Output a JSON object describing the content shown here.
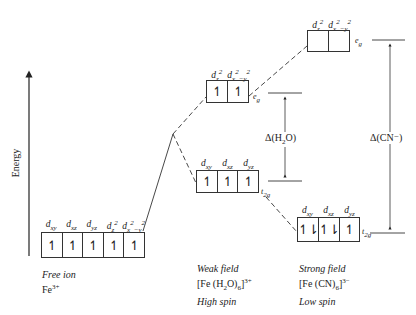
{
  "axis": {
    "label": "Energy"
  },
  "free_ion": {
    "orbitals": [
      "d_xy",
      "d_xz",
      "d_yz",
      "d_z²",
      "d_x²−y²"
    ],
    "occupancy": [
      "↿",
      "↿",
      "↿",
      "↿",
      "↿"
    ],
    "caption": {
      "line1": "Free ion",
      "line2": "Fe3+"
    }
  },
  "weak_field": {
    "eg": {
      "label": "eg",
      "orbitals": [
        "d_z²",
        "d_x²−y²"
      ],
      "occupancy": [
        "↿",
        "↿"
      ]
    },
    "t2g": {
      "label": "t2g",
      "orbitals": [
        "d_xy",
        "d_xz",
        "d_yz"
      ],
      "occupancy": [
        "↿",
        "↿",
        "↿"
      ]
    },
    "delta_label": "Δ(H2O)",
    "caption": {
      "line1": "Weak field",
      "line2": "[Fe (H2O)6]3+",
      "line3": "High spin"
    }
  },
  "strong_field": {
    "eg": {
      "label": "eg",
      "orbitals": [
        "d_z²",
        "d_x²−y²"
      ],
      "occupancy": [
        "",
        ""
      ]
    },
    "t2g": {
      "label": "t2g",
      "orbitals": [
        "d_xy",
        "d_xz",
        "d_yz"
      ],
      "occupancy": [
        "↿⇂",
        "↿⇂",
        "↿"
      ]
    },
    "delta_label": "Δ(CN⁻)",
    "caption": {
      "line1": "Strong field",
      "line2": "[Fe (CN)6]3−",
      "line3": "Low spin"
    }
  }
}
